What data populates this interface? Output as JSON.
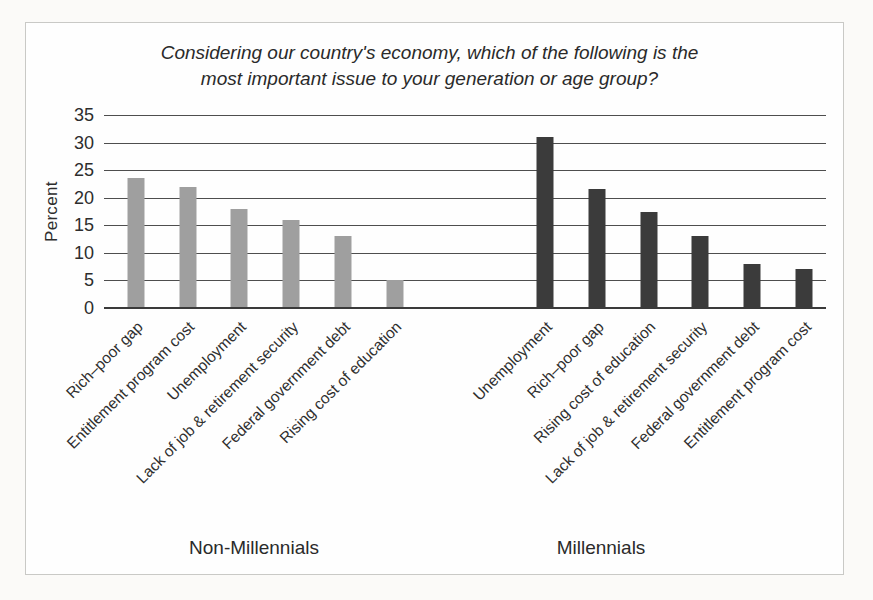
{
  "chart_data": {
    "type": "bar",
    "title": "Considering our country's economy, which of the following is the most important issue to your generation or age group?",
    "title_lines": [
      "Considering our country's economy, which of the following is the",
      "most important issue to your generation or age group?"
    ],
    "ylabel": "Percent",
    "xlabel": "",
    "ylim": [
      0,
      35
    ],
    "yticks": [
      35,
      30,
      25,
      20,
      15,
      10,
      5,
      0
    ],
    "grid": true,
    "legend_position": "none",
    "groups": [
      {
        "label": "Non-Millennials",
        "color": "#9f9f9f",
        "categories": [
          "Rich–poor gap",
          "Entitlement program cost",
          "Unemployment",
          "Lack of job & retirement security",
          "Federal government debt",
          "Rising cost of education"
        ],
        "values": [
          23.5,
          22,
          18,
          16,
          13,
          5
        ]
      },
      {
        "label": "Millennials",
        "color": "#3b3b3b",
        "categories": [
          "Unemployment",
          "Rich–poor gap",
          "Rising cost of education",
          "Lack of job & retirement security",
          "Federal government debt",
          "Entitlement program cost"
        ],
        "values": [
          31,
          21.5,
          17.5,
          13,
          8,
          7
        ]
      }
    ]
  },
  "colors": {
    "background": "#fbfaf8",
    "panel": "#fefefe",
    "border": "#c9c9c6",
    "gridline": "#4e4e4e",
    "text": "#2d2d2d",
    "non_millennials_bar": "#9f9f9f",
    "millennials_bar": "#3b3b3b"
  }
}
